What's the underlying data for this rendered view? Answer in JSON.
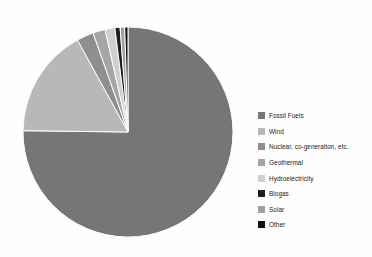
{
  "chart_data": {
    "type": "pie",
    "title": "",
    "legend_position": "right",
    "labels": [
      "Fossil Fuels",
      "Wind",
      "Nuclear, co-generation, etc.",
      "Geothermal",
      "Hydroelectricity",
      "Biogas",
      "Solar",
      "Other"
    ],
    "values": [
      75.2,
      16.8,
      2.6,
      1.9,
      1.5,
      0.8,
      0.7,
      0.5
    ],
    "colors": [
      "#767676",
      "#b8b8b8",
      "#8f8f8f",
      "#a5a5a5",
      "#cfcfcf",
      "#1e1e1e",
      "#a0a0a0",
      "#121212"
    ],
    "start_angle_deg": 0,
    "direction": "clockwise",
    "slice_border_color": "#ffffff",
    "slice_border_width": 1
  },
  "legend": {
    "items": [
      {
        "label": "Fossil Fuels",
        "color": "#767676"
      },
      {
        "label": "Wind",
        "color": "#b8b8b8"
      },
      {
        "label": "Nuclear, co-generation, etc.",
        "color": "#8f8f8f"
      },
      {
        "label": "Geothermal",
        "color": "#a5a5a5"
      },
      {
        "label": "Hydroelectricity",
        "color": "#cfcfcf"
      },
      {
        "label": "Biogas",
        "color": "#1e1e1e"
      },
      {
        "label": "Solar",
        "color": "#a0a0a0"
      },
      {
        "label": "Other",
        "color": "#121212"
      }
    ]
  }
}
